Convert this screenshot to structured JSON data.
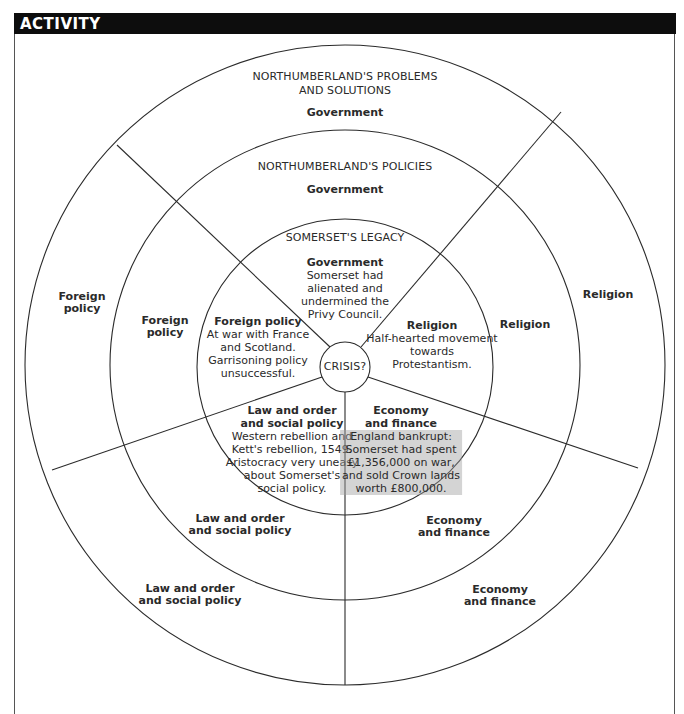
{
  "header": {
    "title": "ACTIVITY"
  },
  "diagram": {
    "center": {
      "label": "CRISIS?"
    },
    "rings": {
      "outer": {
        "title_line1": "NORTHUMBERLAND'S PROBLEMS",
        "title_line2": "AND SOLUTIONS",
        "segments": {
          "government": "Government",
          "religion": "Religion",
          "economy_l1": "Economy",
          "economy_l2": "and finance",
          "law_l1": "Law and order",
          "law_l2": "and social policy",
          "foreign_l1": "Foreign",
          "foreign_l2": "policy"
        }
      },
      "middle": {
        "title": "NORTHUMBERLAND'S POLICIES",
        "segments": {
          "government": "Government",
          "religion": "Religion",
          "economy_l1": "Economy",
          "economy_l2": "and finance",
          "law_l1": "Law and order",
          "law_l2": "and social policy",
          "foreign_l1": "Foreign",
          "foreign_l2": "policy"
        }
      },
      "inner": {
        "title": "SOMERSET'S LEGACY",
        "segments": {
          "government": {
            "heading": "Government",
            "lines": [
              "Somerset had",
              "alienated and",
              "undermined the",
              "Privy Council."
            ]
          },
          "religion": {
            "heading": "Religion",
            "lines": [
              "Half-hearted movement",
              "towards",
              "Protestantism."
            ]
          },
          "economy": {
            "heading_l1": "Economy",
            "heading_l2": "and finance",
            "lines": [
              "England bankrupt:",
              "Somerset had spent",
              "£1,356,000 on war,",
              "and sold Crown lands",
              "worth £800,000."
            ]
          },
          "law": {
            "heading_l1": "Law and order",
            "heading_l2": "and social policy",
            "lines": [
              "Western rebellion and",
              "Kett's rebellion, 1549.",
              "Aristocracy very uneasy",
              "about Somerset's",
              "social policy."
            ]
          },
          "foreign": {
            "heading": "Foreign policy",
            "lines": [
              "At war with France",
              "and Scotland.",
              "Garrisoning policy",
              "unsuccessful."
            ]
          }
        }
      }
    },
    "colors": {
      "line": "#2b2b2b",
      "header_bg": "#0d0d0d",
      "header_text": "#ffffff",
      "highlight": "#a0a0a0"
    }
  }
}
